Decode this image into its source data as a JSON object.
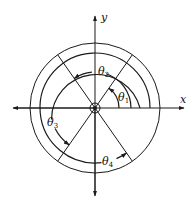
{
  "diagram": {
    "type": "polar-angle-diagram",
    "axes": {
      "x_label": "x",
      "y_label": "y"
    },
    "angles": [
      {
        "symbol": "θ",
        "subscript": "1",
        "from_deg": 0,
        "to_deg": 55,
        "radius": 24
      },
      {
        "symbol": "θ",
        "subscript": "2",
        "from_deg": 0,
        "to_deg": 125,
        "radius": 36
      },
      {
        "symbol": "θ",
        "subscript": "3",
        "from_deg": 0,
        "to_deg": 235,
        "radius": 45
      },
      {
        "symbol": "θ",
        "subscript": "4",
        "from_deg": 0,
        "to_deg": 305,
        "radius": 55
      }
    ],
    "outer_circle_radius": 65,
    "diagonal_angles_deg": [
      55,
      125
    ],
    "colors": {
      "stroke": "#1a1a1a",
      "background": "#ffffff"
    }
  }
}
